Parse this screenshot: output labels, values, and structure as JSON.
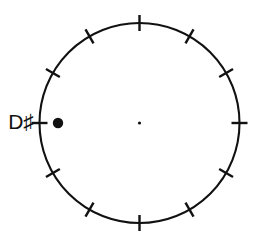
{
  "diagram": {
    "type": "pitch-class-circle",
    "title": "",
    "background_color": "#ffffff",
    "stroke_color": "#111111"
  },
  "circle": {
    "center_x": 139.5,
    "center_y": 123,
    "radius": 100,
    "stroke_width": 2.1
  },
  "center_dot": {
    "x": 139.5,
    "y": 123,
    "radius": 1.6,
    "color": "#111111"
  },
  "ticks": {
    "count": 12,
    "length": 16,
    "step_degrees": 30,
    "stroke_width": 2.4,
    "angles_degrees": [
      0,
      30,
      60,
      90,
      120,
      150,
      180,
      210,
      240,
      270,
      300,
      330
    ],
    "clock_positions": [
      12,
      1,
      2,
      3,
      4,
      5,
      6,
      7,
      8,
      9,
      10,
      11
    ]
  },
  "labels": [
    {
      "text": "D♯",
      "name": "pitch-label-d-sharp",
      "x": 33,
      "y": 123,
      "font_size": 21,
      "anchor": "end"
    }
  ],
  "markers": [
    {
      "name": "pitch-marker-d-sharp",
      "label": "D♯",
      "x": 58,
      "y": 123,
      "radius": 5.2,
      "color": "#111111",
      "filled": true
    }
  ],
  "chart_data": {
    "type": "scatter",
    "title": "",
    "xlabel": "",
    "ylabel": "",
    "grid": false,
    "legend": "none",
    "categories": [
      "D♯"
    ],
    "values": [
      1
    ],
    "points": [
      {
        "label": "D♯",
        "angle_degrees": 270,
        "clock_position": 9,
        "x": 58,
        "y": 123
      }
    ],
    "tick_labels": [
      "",
      "",
      "",
      "",
      "",
      "",
      "",
      "",
      "",
      "D♯",
      "",
      ""
    ],
    "axis_ranges": {
      "angle_degrees": [
        0,
        360
      ],
      "divisions": 12
    }
  }
}
